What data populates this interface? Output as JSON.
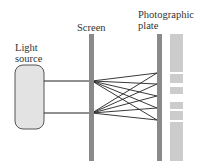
{
  "labels": {
    "light_source": [
      "Light",
      "source"
    ],
    "screen": "Screen",
    "photographic_plate": [
      "Photographic",
      "plate"
    ]
  },
  "colors": {
    "source_fill": "#e3e3e3",
    "source_stroke": "#555555",
    "screen_bar": "#8a8a8a",
    "plate_bar": "#8a8a8a",
    "pattern": "#cccccc",
    "ray": "#222222"
  },
  "geometry": {
    "source_box": {
      "x": 15,
      "y": 65,
      "w": 29,
      "h": 64,
      "r": 8
    },
    "screen_bar": {
      "x": 89,
      "y": 34,
      "w": 5,
      "h": 127
    },
    "plate_bar": {
      "x": 157,
      "y": 34,
      "w": 5,
      "h": 127
    },
    "slits_y": [
      81,
      113
    ],
    "plate_hits_y": [
      73,
      84,
      96,
      108,
      120
    ],
    "pattern_x": 170,
    "pattern_w": 13,
    "pattern_bands": [
      {
        "y": 34,
        "h": 38
      },
      {
        "y": 74,
        "h": 9
      },
      {
        "y": 87,
        "h": 7
      },
      {
        "y": 102,
        "h": 7
      },
      {
        "y": 111,
        "h": 9
      },
      {
        "y": 122,
        "h": 39
      }
    ]
  }
}
